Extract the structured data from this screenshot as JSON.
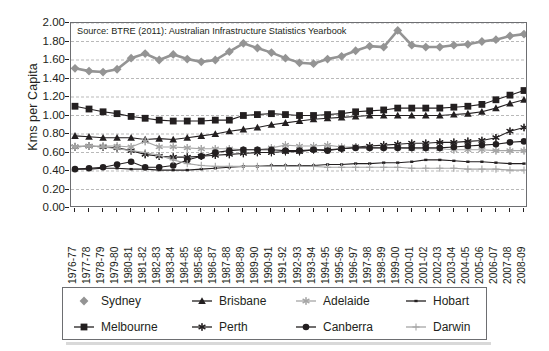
{
  "source_note": "Source: BTRE (2011): Australian Infrastructure Statistics Yearbook",
  "axis": {
    "ylabel": "Kms per Capita",
    "yticks": [
      "0.00",
      "0.20",
      "0.40",
      "0.60",
      "0.80",
      "1.00",
      "1.20",
      "1.40",
      "1.60",
      "1.80",
      "2.00"
    ]
  },
  "legend": {
    "items": [
      {
        "label": "Sydney",
        "icon": "diamond-marker",
        "color": "#949494"
      },
      {
        "label": "Brisbane",
        "icon": "triangle-marker",
        "color": "#231f20"
      },
      {
        "label": "Adelaide",
        "icon": "asterisk-marker",
        "color": "#a6a6a6"
      },
      {
        "label": "Hobart",
        "icon": "smalldash-marker",
        "color": "#231f20"
      },
      {
        "label": "Melbourne",
        "icon": "square-marker",
        "color": "#231f20"
      },
      {
        "label": "Perth",
        "icon": "star-marker",
        "color": "#231f20"
      },
      {
        "label": "Canberra",
        "icon": "circle-marker",
        "color": "#231f20"
      },
      {
        "label": "Darwin",
        "icon": "plus-marker",
        "color": "#a6a6a6"
      }
    ]
  },
  "chart_data": {
    "type": "line",
    "title": "",
    "xlabel": "",
    "ylabel": "Kms per Capita",
    "ylim": [
      0.0,
      2.0
    ],
    "ytick_step": 0.2,
    "grid": true,
    "legend_position": "bottom",
    "categories": [
      "1976-77",
      "1977-78",
      "1978-79",
      "1979-80",
      "1980-81",
      "1981-82",
      "1982-83",
      "1983-84",
      "1984-85",
      "1985-86",
      "1986-87",
      "1987-88",
      "1988-89",
      "1989-90",
      "1990-91",
      "1991-92",
      "1992-93",
      "1993-94",
      "1994-95",
      "1995-96",
      "1996-97",
      "1997-98",
      "1998-99",
      "1999-00",
      "2000-01",
      "2001-02",
      "2002-03",
      "2003-04",
      "2004-05",
      "2005-06",
      "2006-07",
      "2007-08",
      "2008-09"
    ],
    "series": [
      {
        "name": "Sydney",
        "color": "#949494",
        "marker": "diamond",
        "values": [
          1.51,
          1.48,
          1.47,
          1.5,
          1.62,
          1.67,
          1.6,
          1.66,
          1.61,
          1.58,
          1.6,
          1.69,
          1.78,
          1.73,
          1.68,
          1.62,
          1.57,
          1.56,
          1.61,
          1.64,
          1.7,
          1.75,
          1.74,
          1.92,
          1.76,
          1.74,
          1.74,
          1.76,
          1.77,
          1.8,
          1.82,
          1.86,
          1.88
        ]
      },
      {
        "name": "Melbourne",
        "color": "#231f20",
        "marker": "square",
        "values": [
          1.1,
          1.07,
          1.04,
          1.02,
          0.99,
          0.97,
          0.95,
          0.94,
          0.94,
          0.94,
          0.95,
          0.95,
          1.0,
          1.01,
          1.02,
          1.01,
          1.0,
          1.0,
          1.01,
          1.02,
          1.04,
          1.05,
          1.06,
          1.08,
          1.08,
          1.08,
          1.08,
          1.09,
          1.1,
          1.12,
          1.17,
          1.22,
          1.27
        ]
      },
      {
        "name": "Brisbane",
        "color": "#231f20",
        "marker": "triangle",
        "values": [
          0.78,
          0.77,
          0.76,
          0.76,
          0.76,
          0.74,
          0.75,
          0.74,
          0.76,
          0.78,
          0.8,
          0.83,
          0.85,
          0.87,
          0.9,
          0.92,
          0.94,
          0.96,
          0.97,
          0.98,
          0.99,
          1.0,
          1.0,
          1.0,
          1.0,
          1.0,
          1.0,
          1.01,
          1.02,
          1.04,
          1.08,
          1.13,
          1.17
        ]
      },
      {
        "name": "Perth",
        "color": "#231f20",
        "marker": "star",
        "values": [
          0.66,
          0.67,
          0.66,
          0.65,
          0.62,
          0.58,
          0.56,
          0.55,
          0.55,
          0.56,
          0.57,
          0.58,
          0.59,
          0.6,
          0.6,
          0.61,
          0.61,
          0.63,
          0.63,
          0.64,
          0.66,
          0.67,
          0.68,
          0.69,
          0.7,
          0.7,
          0.71,
          0.71,
          0.72,
          0.73,
          0.76,
          0.83,
          0.87
        ]
      },
      {
        "name": "Adelaide",
        "color": "#a6a6a6",
        "marker": "asterisk",
        "values": [
          0.66,
          0.67,
          0.67,
          0.67,
          0.66,
          0.72,
          0.66,
          0.66,
          0.65,
          0.64,
          0.64,
          0.64,
          0.63,
          0.63,
          0.65,
          0.68,
          0.67,
          0.67,
          0.68,
          0.66,
          0.66,
          0.65,
          0.65,
          0.65,
          0.64,
          0.64,
          0.64,
          0.63,
          0.63,
          0.63,
          0.62,
          0.62,
          0.62
        ]
      },
      {
        "name": "Canberra",
        "color": "#231f20",
        "marker": "circle",
        "values": [
          0.42,
          0.43,
          0.44,
          0.47,
          0.5,
          0.44,
          0.44,
          0.46,
          0.52,
          0.56,
          0.6,
          0.62,
          0.63,
          0.63,
          0.63,
          0.62,
          0.62,
          0.63,
          0.62,
          0.64,
          0.65,
          0.65,
          0.65,
          0.65,
          0.65,
          0.65,
          0.65,
          0.66,
          0.67,
          0.68,
          0.69,
          0.71,
          0.72
        ]
      },
      {
        "name": "Hobart",
        "color": "#231f20",
        "marker": "smalldash",
        "values": [
          0.42,
          0.42,
          0.43,
          0.43,
          0.42,
          0.42,
          0.41,
          0.41,
          0.41,
          0.42,
          0.43,
          0.44,
          0.45,
          0.45,
          0.46,
          0.46,
          0.46,
          0.46,
          0.47,
          0.47,
          0.48,
          0.48,
          0.49,
          0.49,
          0.5,
          0.52,
          0.52,
          0.51,
          0.5,
          0.5,
          0.49,
          0.48,
          0.48
        ]
      },
      {
        "name": "Darwin",
        "color": "#a6a6a6",
        "marker": "plus",
        "values": [
          0.67,
          0.67,
          0.66,
          0.64,
          0.62,
          0.6,
          0.57,
          0.52,
          0.48,
          0.46,
          0.45,
          0.45,
          0.45,
          0.45,
          0.45,
          0.45,
          0.45,
          0.45,
          0.44,
          0.44,
          0.44,
          0.44,
          0.44,
          0.44,
          0.43,
          0.43,
          0.43,
          0.43,
          0.42,
          0.42,
          0.42,
          0.41,
          0.41
        ]
      }
    ]
  }
}
